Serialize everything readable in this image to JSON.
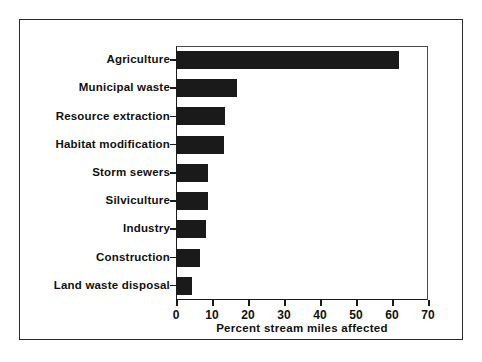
{
  "chart_data": {
    "type": "bar",
    "orientation": "horizontal",
    "title": "",
    "xlabel": "Percent stream miles affected",
    "ylabel": "",
    "xlim": [
      0,
      70
    ],
    "xticks": [
      0,
      10,
      20,
      30,
      40,
      50,
      60,
      70
    ],
    "xtick_labels": [
      "0",
      "10",
      "20",
      "30",
      "40",
      "50",
      "60",
      "70"
    ],
    "grid": false,
    "legend": null,
    "bar_color": "#1a1a1a",
    "frame_color": "#1a1a1a",
    "categories": [
      "Agriculture",
      "Municipal waste",
      "Resource extraction",
      "Habitat modification",
      "Storm sewers",
      "Silviculture",
      "Industry",
      "Construction",
      "Land waste disposal"
    ],
    "values": [
      62,
      17,
      13.7,
      13.2,
      9,
      9,
      8.4,
      6.7,
      4.5
    ]
  }
}
